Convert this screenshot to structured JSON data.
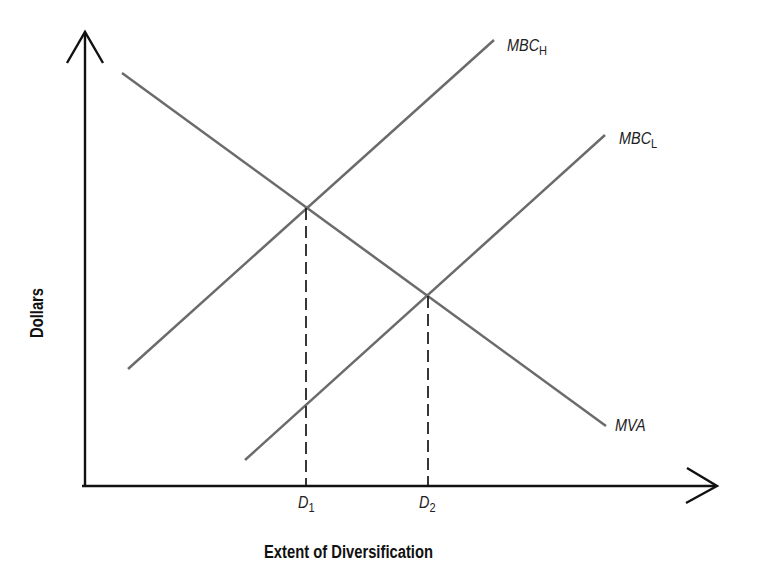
{
  "diagram": {
    "type": "economic-supply-demand-style",
    "x_axis_title": "Extent of Diversification",
    "y_axis_title": "Dollars",
    "curves": [
      {
        "id": "mbc_h",
        "label_main": "MBC",
        "label_sub": "H",
        "slope": "upward",
        "color": "#666666"
      },
      {
        "id": "mbc_l",
        "label_main": "MBC",
        "label_sub": "L",
        "slope": "upward",
        "color": "#666666"
      },
      {
        "id": "mva",
        "label_main": "MVA",
        "label_sub": "",
        "slope": "downward",
        "color": "#666666"
      }
    ],
    "x_ticks": [
      {
        "main": "D",
        "sub": "1",
        "description": "intersection of MVA and MBC_H"
      },
      {
        "main": "D",
        "sub": "2",
        "description": "intersection of MVA and MBC_L"
      }
    ],
    "colors": {
      "axis": "#111111",
      "curve": "#666666",
      "dashed": "#222222",
      "background": "#ffffff"
    }
  }
}
